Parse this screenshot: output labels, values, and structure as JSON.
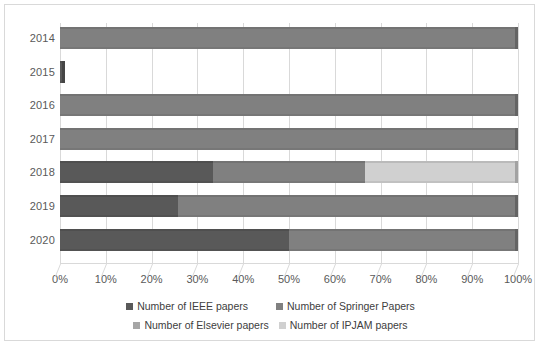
{
  "chart_data": {
    "type": "bar",
    "subtype": "100% stacked horizontal bar",
    "title": "",
    "xlabel": "",
    "ylabel": "",
    "categories": [
      "2014",
      "2015",
      "2016",
      "2017",
      "2018",
      "2019",
      "2020"
    ],
    "xlim": [
      0,
      100
    ],
    "x_ticks": [
      "0%",
      "10%",
      "20%",
      "30%",
      "40%",
      "50%",
      "60%",
      "70%",
      "80%",
      "90%",
      "100%"
    ],
    "x_tick_values": [
      0,
      10,
      20,
      30,
      40,
      50,
      60,
      70,
      80,
      90,
      100
    ],
    "grid": true,
    "legend_position": "bottom",
    "series": [
      {
        "name": "Number of IEEE papers",
        "color": "#595959",
        "values": [
          0,
          100,
          0,
          0,
          33.3,
          25.8,
          50.0
        ]
      },
      {
        "name": "Number of Springer Papers",
        "color": "#808080",
        "values": [
          100,
          0,
          100,
          100,
          33.4,
          74.2,
          50.0
        ]
      },
      {
        "name": "Number of Elsevier papers",
        "color": "#a6a6a6",
        "values": [
          0,
          0,
          0,
          0,
          0,
          0,
          0
        ]
      },
      {
        "name": "Number of IPJAM papers",
        "color": "#d0d0d0",
        "values": [
          0,
          0,
          0,
          0,
          33.3,
          0,
          0
        ]
      }
    ],
    "bar_widths_percent": [
      100,
      1.2,
      100,
      100,
      100,
      100,
      100
    ]
  },
  "axis": {
    "y_labels": [
      "2014",
      "2015",
      "2016",
      "2017",
      "2018",
      "2019",
      "2020"
    ],
    "x_labels": [
      "0%",
      "10%",
      "20%",
      "30%",
      "40%",
      "50%",
      "60%",
      "70%",
      "80%",
      "90%",
      "100%"
    ]
  },
  "legend": {
    "items": [
      {
        "label": "Number of IEEE papers",
        "color": "#595959"
      },
      {
        "label": "Number of Springer Papers",
        "color": "#808080"
      },
      {
        "label": "Number of Elsevier papers",
        "color": "#a6a6a6"
      },
      {
        "label": "Number of IPJAM papers",
        "color": "#d0d0d0"
      }
    ]
  },
  "style": {
    "background": "#ffffff",
    "grid_color": "#d9d9d9",
    "border_color": "#d9d9d9",
    "text_color": "#595959"
  }
}
